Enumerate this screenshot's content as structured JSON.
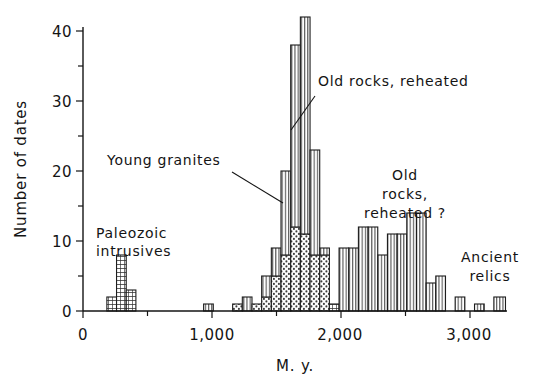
{
  "chart_data": {
    "type": "bar",
    "title": "",
    "subtitle": "",
    "xlabel": "M. y.",
    "ylabel": "Number of dates",
    "xlim": [
      0,
      3500
    ],
    "ylim": [
      0,
      45
    ],
    "grid": false,
    "legend_position": "none",
    "x_major_ticks": [
      0,
      1000,
      2000,
      3000
    ],
    "x_major_tick_labels": [
      "0",
      "1,000",
      "2,000",
      "3,000"
    ],
    "x_minor_ticks": [
      500,
      1500,
      2500,
      3500
    ],
    "y_major_ticks": [
      0,
      10,
      20,
      30,
      40
    ],
    "y_major_tick_labels": [
      "0",
      "10",
      "20",
      "30",
      "40"
    ],
    "y_minor_ticks": [
      5,
      15,
      25,
      35,
      45
    ],
    "bin_width": 75,
    "patterns": {
      "grid": "Paleozoic intrusives (cross-hatch / grid fill)",
      "dots": "Young granites (stipple / dotted fill)",
      "vlines": "Old rocks, reheated (vertical line fill)"
    },
    "bars": [
      {
        "x0": 185,
        "x1": 260,
        "pattern": "grid",
        "value": 2
      },
      {
        "x0": 260,
        "x1": 335,
        "pattern": "grid",
        "value": 8
      },
      {
        "x0": 335,
        "x1": 410,
        "pattern": "grid",
        "value": 3
      },
      {
        "x0": 935,
        "x1": 1010,
        "pattern": "vlines",
        "value": 1
      },
      {
        "x0": 1160,
        "x1": 1235,
        "pattern": "dots",
        "value": 1
      },
      {
        "x0": 1235,
        "x1": 1310,
        "pattern": "vlines",
        "value": 2
      },
      {
        "x0": 1310,
        "x1": 1385,
        "pattern": "dots",
        "value": 1
      },
      {
        "x0": 1385,
        "x1": 1460,
        "pattern": "dots",
        "value": 2
      },
      {
        "x0": 1385,
        "x1": 1460,
        "pattern": "vlines",
        "value": 5,
        "stacked_on": 2
      },
      {
        "x0": 1460,
        "x1": 1535,
        "pattern": "dots",
        "value": 5
      },
      {
        "x0": 1460,
        "x1": 1535,
        "pattern": "vlines",
        "value": 9,
        "stacked_on": 5
      },
      {
        "x0": 1535,
        "x1": 1610,
        "pattern": "dots",
        "value": 8
      },
      {
        "x0": 1535,
        "x1": 1610,
        "pattern": "vlines",
        "value": 20,
        "stacked_on": 8
      },
      {
        "x0": 1610,
        "x1": 1685,
        "pattern": "dots",
        "value": 12
      },
      {
        "x0": 1610,
        "x1": 1685,
        "pattern": "vlines",
        "value": 38,
        "stacked_on": 12
      },
      {
        "x0": 1685,
        "x1": 1760,
        "pattern": "dots",
        "value": 11
      },
      {
        "x0": 1685,
        "x1": 1760,
        "pattern": "vlines",
        "value": 42,
        "stacked_on": 11
      },
      {
        "x0": 1760,
        "x1": 1835,
        "pattern": "dots",
        "value": 8
      },
      {
        "x0": 1760,
        "x1": 1835,
        "pattern": "vlines",
        "value": 23,
        "stacked_on": 8
      },
      {
        "x0": 1835,
        "x1": 1910,
        "pattern": "dots",
        "value": 8
      },
      {
        "x0": 1835,
        "x1": 1910,
        "pattern": "vlines",
        "value": 9,
        "stacked_on": 8
      },
      {
        "x0": 1910,
        "x1": 1985,
        "pattern": "grid",
        "value": 1
      },
      {
        "x0": 1985,
        "x1": 2060,
        "pattern": "vlines",
        "value": 9
      },
      {
        "x0": 2060,
        "x1": 2135,
        "pattern": "vlines",
        "value": 9
      },
      {
        "x0": 2135,
        "x1": 2210,
        "pattern": "vlines",
        "value": 12
      },
      {
        "x0": 2210,
        "x1": 2285,
        "pattern": "vlines",
        "value": 12
      },
      {
        "x0": 2285,
        "x1": 2360,
        "pattern": "vlines",
        "value": 8
      },
      {
        "x0": 2360,
        "x1": 2435,
        "pattern": "vlines",
        "value": 11
      },
      {
        "x0": 2435,
        "x1": 2510,
        "pattern": "vlines",
        "value": 11
      },
      {
        "x0": 2510,
        "x1": 2585,
        "pattern": "vlines",
        "value": 14
      },
      {
        "x0": 2585,
        "x1": 2660,
        "pattern": "vlines",
        "value": 14
      },
      {
        "x0": 2660,
        "x1": 2735,
        "pattern": "vlines",
        "value": 4
      },
      {
        "x0": 2735,
        "x1": 2810,
        "pattern": "vlines",
        "value": 5
      },
      {
        "x0": 2810,
        "x1": 2885,
        "pattern": "vlines",
        "value": 0
      },
      {
        "x0": 2885,
        "x1": 2960,
        "pattern": "vlines",
        "value": 2
      },
      {
        "x0": 3035,
        "x1": 3110,
        "pattern": "vlines",
        "value": 1
      },
      {
        "x0": 3185,
        "x1": 3275,
        "pattern": "vlines",
        "value": 2
      }
    ],
    "annotations": [
      {
        "name": "paleozoic-intrusives",
        "text_lines": [
          "Paleozoic",
          "intrusives"
        ],
        "leader": false
      },
      {
        "name": "young-granites",
        "text_lines": [
          "Young granites"
        ],
        "leader": true
      },
      {
        "name": "old-rocks-reheated",
        "text_lines": [
          "Old rocks, reheated"
        ],
        "leader": true
      },
      {
        "name": "old-rocks-reheated-query",
        "text_lines": [
          "Old",
          "rocks,",
          "reheated ?"
        ],
        "leader": false
      },
      {
        "name": "ancient-relics",
        "text_lines": [
          "Ancient",
          "relics"
        ],
        "leader": false
      }
    ]
  },
  "labels": {
    "y_axis": "Number of dates",
    "x_axis": "M. y.",
    "y_ticks": {
      "t0": "0",
      "t10": "10",
      "t20": "20",
      "t30": "30",
      "t40": "40"
    },
    "x_ticks": {
      "t0": "0",
      "t1000": "1,000",
      "t2000": "2,000",
      "t3000": "3,000"
    },
    "annot_paleozoic_l1": "Paleozoic",
    "annot_paleozoic_l2": "intrusives",
    "annot_young_granites": "Young granites",
    "annot_old_rocks_reheated": "Old rocks, reheated",
    "annot_old_rocks_q_l1": "Old",
    "annot_old_rocks_q_l2": "rocks,",
    "annot_old_rocks_q_l3": "reheated ?",
    "annot_ancient_l1": "Ancient",
    "annot_ancient_l2": "relics"
  },
  "colors": {
    "ink": "#141414",
    "paper": "#ffffff",
    "bar_stroke": "#1d1d1d",
    "grid_fill": "#3a3a3a",
    "dots_fill": "#555555",
    "vlines_fill": "#6a6a6a"
  }
}
